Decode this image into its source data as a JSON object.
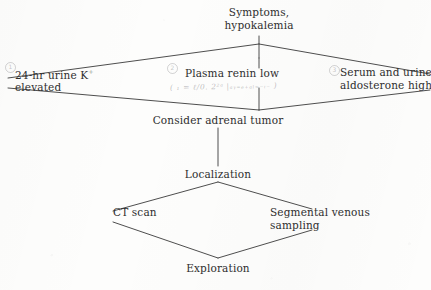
{
  "diagram": {
    "type": "flowchart",
    "background_color": "#fdfdfc",
    "line_color": "#3a3a3a",
    "text_color": "#2e2e2e",
    "nodes": [
      {
        "id": "symptoms",
        "line1": "Symptoms,",
        "line2": "hypokalemia",
        "role": "entry"
      },
      {
        "id": "urine-potassium",
        "line1": "24-hr urine K",
        "superscript": "+",
        "line2": "elevated",
        "role": "test",
        "marker": "1"
      },
      {
        "id": "plasma-renin",
        "line1": "Plasma renin low",
        "line2": "",
        "role": "test",
        "marker": "2"
      },
      {
        "id": "aldosterone",
        "line1": "Serum and urine",
        "line2": "aldosterone high",
        "role": "test",
        "marker": "3"
      },
      {
        "id": "consider-tumor",
        "line1": "Consider adrenal tumor",
        "line2": "",
        "role": "conclusion"
      },
      {
        "id": "localization",
        "line1": "Localization",
        "line2": "",
        "role": "stage"
      },
      {
        "id": "ct-scan",
        "line1": "CT scan",
        "line2": "",
        "role": "procedure"
      },
      {
        "id": "venous-sampling",
        "line1": "Segmental venous",
        "line2": "sampling",
        "role": "procedure"
      },
      {
        "id": "exploration",
        "line1": "Exploration",
        "line2": "",
        "role": "outcome"
      }
    ],
    "annotation": {
      "id": "pencil-note",
      "text": "( ₁ = ℓ/0. 2²ᵃ |ₐᵧ₌ₑ₊ₐₗ₌₋ᵢ₋ )",
      "legible": false,
      "medium": "pencil"
    }
  }
}
